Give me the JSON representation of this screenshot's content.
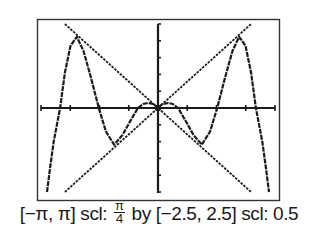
{
  "chart_data": {
    "type": "line",
    "title": "",
    "xlabel": "",
    "ylabel": "",
    "xlim": [
      -3.14159,
      3.14159
    ],
    "ylim": [
      -2.5,
      2.5
    ],
    "xscl": 0.785398,
    "yscl": 0.5,
    "grid": false,
    "axes_through_origin": true,
    "series": [
      {
        "name": "curve",
        "x": [
          -2.98,
          -2.9,
          -2.8,
          -2.63,
          -2.5,
          -2.35,
          -2.18,
          -2.0,
          -1.8,
          -1.59,
          -1.4,
          -1.18,
          -0.95,
          -0.75,
          -0.54,
          -0.4,
          -0.27,
          -0.12,
          0,
          0.12,
          0.27,
          0.4,
          0.54,
          0.75,
          0.95,
          1.18,
          1.4,
          1.59,
          1.8,
          2.0,
          2.18,
          2.35,
          2.5,
          2.63,
          2.8,
          2.9,
          2.98
        ],
        "y": [
          -2.5,
          -1.8,
          -1.0,
          0,
          1.05,
          1.85,
          2.12,
          1.7,
          0.9,
          0,
          -0.7,
          -1.09,
          -0.8,
          -0.4,
          0,
          0.12,
          0.15,
          0.12,
          0,
          0.12,
          0.15,
          0.12,
          0,
          -0.4,
          -0.8,
          -1.09,
          -0.7,
          0,
          0.9,
          1.7,
          2.12,
          1.85,
          1.05,
          0,
          -1.0,
          -1.8,
          -2.5
        ]
      },
      {
        "name": "y = x",
        "x": [
          -2.5,
          2.5
        ],
        "y": [
          -2.5,
          2.5
        ]
      },
      {
        "name": "y = -x",
        "x": [
          -2.5,
          2.5
        ],
        "y": [
          2.5,
          -2.5
        ]
      }
    ]
  },
  "caption": {
    "xrange": "[−π, π] scl: ",
    "xscl_num": "π",
    "xscl_den": "4",
    "yrange": " by [−2.5, 2.5] scl: 0.5"
  },
  "colors": {
    "ink": "#1a1a1a",
    "frame": "#333333",
    "background": "#ffffff"
  }
}
